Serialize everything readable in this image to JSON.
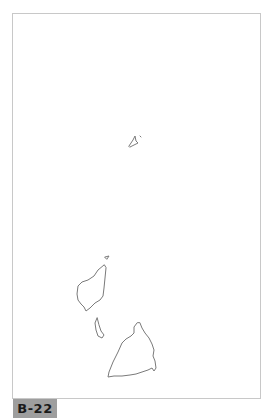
{
  "figure": {
    "label": "B-22",
    "colors": {
      "frame_border": "#c8c8c8",
      "outline": "#7a7a7a",
      "label_bg": "#9e9e9e",
      "label_text": "#1a1a1a"
    }
  }
}
